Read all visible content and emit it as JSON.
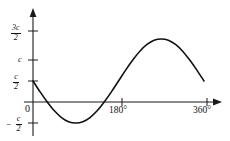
{
  "chart_data": {
    "type": "line",
    "title": "",
    "xlabel": "",
    "ylabel": "",
    "xlim": [
      0,
      360
    ],
    "ylim": [
      -1.0,
      1.85
    ],
    "grid": false,
    "legend_position": "none",
    "x_unit": "degrees",
    "amplitude_label": "c",
    "vertical_offset_label": "c/2",
    "x_ticks": [
      {
        "value": 180,
        "label": "180°"
      },
      {
        "value": 360,
        "label": "360°"
      }
    ],
    "y_ticks": [
      {
        "value": 1.5,
        "numerator": "3c",
        "denominator": "2",
        "label": "3c/2"
      },
      {
        "value": 1.0,
        "numerator": "",
        "denominator": "",
        "label": "c"
      },
      {
        "value": 0.5,
        "numerator": "c",
        "denominator": "2",
        "label": "c/2"
      },
      {
        "value": -0.5,
        "numerator": "c",
        "denominator": "2",
        "label": "-c/2",
        "negative": true
      }
    ],
    "origin_label": "0",
    "series": [
      {
        "name": "curve",
        "color": "#111111",
        "x": [
          0,
          15,
          30,
          45,
          60,
          75,
          90,
          105,
          120,
          135,
          150,
          165,
          180,
          195,
          210,
          225,
          240,
          255,
          270,
          285,
          300,
          315,
          330,
          345,
          360
        ],
        "y": [
          0.5,
          0.24,
          0.0,
          -0.21,
          -0.37,
          -0.47,
          -0.5,
          -0.47,
          -0.37,
          -0.21,
          0.0,
          0.24,
          0.5,
          0.76,
          1.0,
          1.21,
          1.37,
          1.47,
          1.5,
          1.47,
          1.37,
          1.21,
          1.0,
          0.76,
          0.5
        ]
      }
    ]
  },
  "axes": {
    "x_axis_name": "x-axis",
    "y_axis_name": "y-axis",
    "x_arrow": "arrow-right",
    "y_arrow": "arrow-up",
    "origin_label": "0"
  },
  "labels": {
    "y_3c_over_2_num": "3c",
    "y_3c_over_2_den": "2",
    "y_c": "c",
    "y_c_over_2_num": "c",
    "y_c_over_2_den": "2",
    "y_neg_c_over_2_sign": "−",
    "y_neg_c_over_2_num": "c",
    "y_neg_c_over_2_den": "2",
    "x_180": "180°",
    "x_360": "360°",
    "origin": "0"
  },
  "colors": {
    "curve": "#111111",
    "axis": "#1a1a1a",
    "background": "#ffffff",
    "text": "#111111"
  }
}
